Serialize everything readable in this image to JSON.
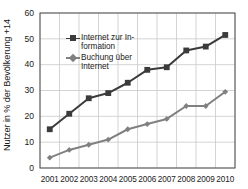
{
  "chart_data": {
    "type": "line",
    "title": "",
    "xlabel": "",
    "ylabel": "Nutzer in % der Bevölkerung +14",
    "categories": [
      "2001",
      "2002",
      "2003",
      "2004",
      "2005",
      "2006",
      "2007",
      "2008",
      "2009",
      "2010"
    ],
    "x": [
      2001,
      2002,
      2003,
      2004,
      2005,
      2006,
      2007,
      2008,
      2009,
      2010
    ],
    "ylim": [
      0,
      60
    ],
    "yticks": [
      0,
      10,
      20,
      30,
      40,
      50,
      60
    ],
    "grid": true,
    "legend_position": "upper-left-inside",
    "series": [
      {
        "name": "Internet zur In-formation",
        "name_plain": "Internet zur Information",
        "marker": "square",
        "color": "#3b3b3b",
        "values": [
          15,
          21,
          27,
          29,
          33,
          38,
          39,
          45.5,
          47,
          51.5
        ]
      },
      {
        "name": "Buchung über Internet",
        "name_plain": "Buchung über Internet",
        "marker": "diamond",
        "color": "#808080",
        "values": [
          4,
          7,
          9,
          11,
          15,
          17,
          19,
          24,
          24,
          29.5
        ]
      }
    ]
  },
  "axes": {
    "y_title": "Nutzer in % der Bevölkerung +14",
    "y_tick_labels": [
      "60",
      "50",
      "40",
      "30",
      "20",
      "10",
      "0"
    ],
    "x_tick_labels": [
      "2001",
      "2002",
      "2003",
      "2004",
      "2005",
      "2006",
      "2007",
      "2008",
      "2009",
      "2010"
    ]
  },
  "legend": {
    "items": [
      {
        "line1": "Internet zur In-",
        "line2": "formation"
      },
      {
        "line1": "Buchung über",
        "line2": "Internet"
      }
    ]
  },
  "colors": {
    "series_dark": "#3b3b3b",
    "series_gray": "#808080",
    "grid": "#c9c9c9",
    "axis": "#4d4d4d",
    "background": "#ffffff"
  }
}
